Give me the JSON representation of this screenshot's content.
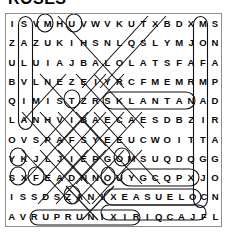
{
  "title": "ROSES",
  "puzzle": {
    "type": "word-search",
    "rows": 11,
    "cols": 12,
    "grid": [
      [
        "I",
        "S",
        "V",
        "M",
        "H",
        "U",
        "V",
        "W",
        "V",
        "K",
        "U",
        "T",
        "X",
        "B",
        "D",
        "X",
        "M",
        "S"
      ],
      [
        "Z",
        "A",
        "Z",
        "U",
        "K",
        "I",
        "H",
        "S",
        "N",
        "L",
        "Q",
        "S",
        "L",
        "Y",
        "M",
        "J",
        "O",
        "N"
      ],
      [
        "U",
        "L",
        "U",
        "I",
        "A",
        "J",
        "B",
        "A",
        "L",
        "O",
        "L",
        "A",
        "T",
        "S",
        "F",
        "A",
        "F",
        "A"
      ],
      [
        "B",
        "V",
        "L",
        "N",
        "E",
        "Z",
        "E",
        "I",
        "Y",
        "R",
        "C",
        "F",
        "M",
        "E",
        "M",
        "R",
        "M",
        "P"
      ],
      [
        "Q",
        "I",
        "M",
        "I",
        "S",
        "T",
        "Z",
        "R",
        "S",
        "K",
        "L",
        "A",
        "N",
        "T",
        "A",
        "N",
        "A",
        "D"
      ],
      [
        "L",
        "A",
        "N",
        "H",
        "V",
        "I",
        "B",
        "A",
        "E",
        "C",
        "A",
        "E",
        "S",
        "D",
        "B",
        "Z",
        "I",
        "R"
      ],
      [
        "O",
        "V",
        "S",
        "P",
        "A",
        "F",
        "S",
        "Y",
        "E",
        "E",
        "U",
        "E",
        "U",
        "C",
        "W",
        "O",
        "I",
        "T",
        "T",
        "A"
      ],
      [
        "Y",
        "K",
        "J",
        "L",
        "J",
        "I",
        "E",
        "P",
        "G",
        "O",
        "M",
        "O",
        "M",
        "S",
        "U",
        "Q",
        "D",
        "Q",
        "G",
        "G"
      ],
      [
        "S",
        "X",
        "F",
        "E",
        "A",
        "D",
        "N",
        "N",
        "O",
        "U",
        "Y",
        "Y",
        "G",
        "C",
        "Q",
        "P",
        "X",
        "J",
        "O"
      ],
      [
        "I",
        "S",
        "S",
        "D",
        "S",
        "Z",
        "A",
        "N",
        "I",
        "X",
        "E",
        "A",
        "S",
        "U",
        "E",
        "L",
        "O",
        "C",
        "N"
      ],
      [
        "A",
        "V",
        "R",
        "U",
        "P",
        "R",
        "U",
        "N",
        "I",
        "X",
        "I",
        "R",
        "I",
        "Q",
        "C",
        "A",
        "J",
        "F",
        "L"
      ],
      [
        "D",
        "A",
        "S",
        "B",
        "D",
        "O",
        "A",
        "T",
        "N",
        "Z",
        "J",
        "O",
        "R",
        "Z",
        "F",
        "A",
        "R",
        "V"
      ],
      [
        "N",
        "A",
        "X",
        "I",
        "Y",
        "X",
        "R",
        "L",
        "V",
        "N",
        "K",
        "K",
        "F",
        "C",
        "V",
        "D",
        "B",
        "Q",
        "U"
      ],
      [
        "N",
        "H",
        "H",
        "L",
        "E",
        "Z",
        "I",
        "L",
        "H",
        "B",
        "S",
        "I",
        "T",
        "A",
        "M",
        "E",
        "L",
        "C"
      ],
      [
        "V",
        "O",
        "D",
        "G",
        "H",
        "L",
        "K",
        "M",
        "I",
        "G",
        "O",
        "M",
        "P",
        "H",
        "R",
        "E",
        "N",
        "A"
      ],
      [
        "P",
        "C",
        "J",
        "V",
        "L",
        "A",
        "G",
        "D",
        "S",
        "L",
        "Z",
        "H",
        "I",
        "R",
        "N",
        "N",
        "I",
        "E"
      ],
      [
        "Z",
        "Z",
        "F",
        "E",
        "F",
        "E",
        "D",
        "C",
        "J",
        "X",
        "Y",
        "A",
        "L",
        "D",
        "U",
        "B",
        "O",
        "K"
      ],
      [
        "O",
        "I",
        "A",
        "R",
        "E",
        "W",
        "O",
        "L",
        "F",
        "N",
        "U",
        "S",
        "A",
        "M",
        "V",
        "O",
        "S",
        "I"
      ]
    ],
    "rows_text": [
      "I S V M H U V W V K U T X B D X M S",
      "Z A Z U K I H S N L Q S L Y M J O N",
      "U L U I A J B A L O L A T S F A F A",
      "B V L N E Z E I Y R C F M E M R M P",
      "Q I M I S T Z R S K L A N T A N A D",
      "L A N H V I B A E C A E S D B Z I R",
      "O V S P A F S Y E E U C W O I T T A",
      "Y K J L J I E P G O M S U Q D Q G G",
      "S X F E A D N N O U Y G C Q P X J O",
      "I S S D S Z A N I X E A S U E L O C N",
      "A V R U P R U N I X I R I Q C A J F L",
      "D A S B D O A T N Z J O R Z F A R V",
      "N A X I Y X R L V N K K F C V D B Q U",
      "N H H L E Z I L H B S I T A M E L C",
      "V O D G H L K M I G O M P H R E N A",
      "P C J V L A G D S L Z H I R N N I E",
      "Z Z F E F E D C J X Y A L D U B O K",
      "O I A R E W O L F N U S A M V O S I"
    ],
    "found_words": [
      {
        "word": "SALVIA",
        "display": "SALVIA",
        "direction": "vertical-down",
        "marked": true
      },
      {
        "word": "SNAPDRAGON",
        "display": "SNAPDRAGON",
        "direction": "vertical-down",
        "marked": true
      },
      {
        "word": "LANTANA",
        "display": "LANTANA",
        "direction": "horizontal",
        "marked": true
      },
      {
        "word": "COLEUS",
        "display": "SUELOC",
        "direction": "horizontal-reverse",
        "marked": true
      },
      {
        "word": "CLEMATIS",
        "display": "SITAMELC",
        "direction": "horizontal-reverse",
        "marked": true
      },
      {
        "word": "GOMPHRENA",
        "display": "GOMPHRENA",
        "direction": "horizontal",
        "marked": true
      },
      {
        "word": "SUNFLOWER",
        "display": "AREWOLFNUS",
        "direction": "horizontal-reverse",
        "marked": true
      }
    ]
  },
  "colors": {
    "ink": "#0a0a0a",
    "frame": "#8d8d8d",
    "mark": "#111111",
    "background": "#ffffff"
  }
}
